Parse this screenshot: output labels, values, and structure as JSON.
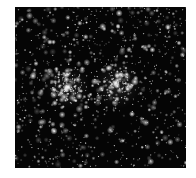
{
  "image": {
    "subject": "star field with two open star clusters",
    "background_color": "#050505",
    "page_background": "#ffffff",
    "frame": {
      "x": 15,
      "y": 7,
      "width": 171,
      "height": 161
    },
    "clusters": [
      {
        "name": "left-cluster",
        "cx": 53,
        "cy": 80,
        "radius": 22,
        "count": 140
      },
      {
        "name": "right-cluster",
        "cx": 102,
        "cy": 78,
        "radius": 24,
        "count": 130
      }
    ],
    "field_star_count": 900,
    "bright_stars": [
      {
        "x": 18,
        "y": 69,
        "r": 1.8
      },
      {
        "x": 39,
        "y": 124,
        "r": 1.8
      },
      {
        "x": 53,
        "y": 80,
        "r": 2.4
      },
      {
        "x": 101,
        "y": 76,
        "r": 2.0
      },
      {
        "x": 153,
        "y": 20,
        "r": 1.6
      },
      {
        "x": 117,
        "y": 107,
        "r": 1.5
      },
      {
        "x": 35,
        "y": 35,
        "r": 1.4
      },
      {
        "x": 102,
        "y": 92,
        "r": 1.4
      },
      {
        "x": 103,
        "y": 19,
        "r": 1.2
      },
      {
        "x": 164,
        "y": 36,
        "r": 1.2
      }
    ]
  }
}
